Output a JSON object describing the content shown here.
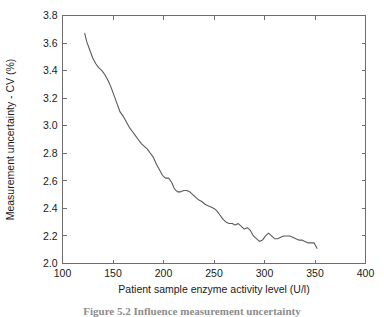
{
  "figure": {
    "caption": "Figure 5.2   Influence measurement uncertainty"
  },
  "chart_data": {
    "type": "line",
    "title": "",
    "xlabel": "Patient sample enzyme activity level (U/l)",
    "ylabel": "Measurement uncertainty - CV (%)",
    "xlim": [
      100,
      400
    ],
    "ylim": [
      2.0,
      3.8
    ],
    "grid": false,
    "legend": null,
    "xticks": [
      100,
      150,
      200,
      250,
      300,
      350,
      400
    ],
    "xticklabels": [
      "100",
      "150",
      "200",
      "250",
      "300",
      "350",
      "400"
    ],
    "yticks": [
      2.0,
      2.2,
      2.4,
      2.6,
      2.8,
      3.0,
      3.2,
      3.4,
      3.6,
      3.8
    ],
    "yticklabels": [
      "2.0",
      "2.2",
      "2.4",
      "2.6",
      "2.8",
      "3.0",
      "3.2",
      "3.4",
      "3.6",
      "3.8"
    ],
    "series": [
      {
        "name": "Measurement uncertainty",
        "color": "#5a5a5a",
        "x": [
          122,
          124,
          127,
          130,
          133,
          136,
          139,
          142,
          145,
          148,
          151,
          154,
          157,
          160,
          163,
          166,
          169,
          172,
          175,
          178,
          181,
          184,
          187,
          190,
          193,
          196,
          199,
          202,
          205,
          208,
          211,
          214,
          217,
          220,
          223,
          226,
          229,
          232,
          235,
          238,
          241,
          244,
          247,
          250,
          253,
          256,
          259,
          262,
          265,
          268,
          271,
          274,
          277,
          280,
          283,
          286,
          289,
          292,
          295,
          298,
          301,
          304,
          307,
          310,
          313,
          316,
          319,
          322,
          325,
          328,
          331,
          334,
          337,
          340,
          343,
          346,
          349,
          352
        ],
        "y": [
          3.67,
          3.61,
          3.55,
          3.49,
          3.45,
          3.42,
          3.4,
          3.37,
          3.33,
          3.28,
          3.22,
          3.16,
          3.1,
          3.07,
          3.03,
          2.99,
          2.96,
          2.93,
          2.9,
          2.87,
          2.85,
          2.83,
          2.8,
          2.77,
          2.72,
          2.68,
          2.64,
          2.62,
          2.62,
          2.59,
          2.54,
          2.52,
          2.52,
          2.53,
          2.53,
          2.52,
          2.5,
          2.48,
          2.46,
          2.45,
          2.43,
          2.42,
          2.41,
          2.4,
          2.38,
          2.35,
          2.32,
          2.3,
          2.29,
          2.29,
          2.28,
          2.29,
          2.27,
          2.25,
          2.26,
          2.24,
          2.2,
          2.18,
          2.16,
          2.17,
          2.2,
          2.22,
          2.2,
          2.18,
          2.18,
          2.19,
          2.2,
          2.2,
          2.2,
          2.19,
          2.18,
          2.17,
          2.17,
          2.16,
          2.15,
          2.15,
          2.15,
          2.11
        ]
      }
    ]
  }
}
